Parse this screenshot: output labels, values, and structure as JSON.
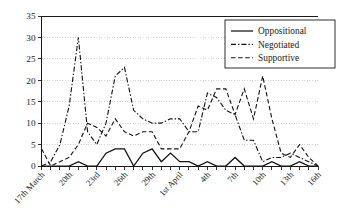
{
  "chart_data": {
    "type": "line",
    "title": "",
    "xlabel": "",
    "ylabel": "",
    "ylim": [
      0,
      35
    ],
    "yticks": [
      0,
      5,
      10,
      15,
      20,
      25,
      30,
      35
    ],
    "grid": true,
    "legend_position": "top-right",
    "x": [
      "17th March",
      "18th",
      "19th",
      "20th",
      "21st",
      "22nd",
      "23rd",
      "24th",
      "25th",
      "26th",
      "27th",
      "28th",
      "29th",
      "30th",
      "31st",
      "1st April",
      "2nd",
      "3rd",
      "4th",
      "5th",
      "6th",
      "7th",
      "8th",
      "9th",
      "10th",
      "11th",
      "12th",
      "13th",
      "14th",
      "15th",
      "16th"
    ],
    "xtick_labels": [
      "17th March",
      "20th",
      "23rd",
      "26th",
      "29th",
      "1st April",
      "4th",
      "7th",
      "10th",
      "13th",
      "16th"
    ],
    "xtick_indices": [
      0,
      3,
      6,
      9,
      12,
      15,
      18,
      21,
      24,
      27,
      30
    ],
    "series": [
      {
        "name": "Oppositional",
        "style": "solid",
        "values": [
          0,
          0,
          0,
          0,
          1,
          0,
          0,
          3,
          4,
          4,
          0,
          3,
          4,
          1,
          3,
          1,
          1,
          0,
          1,
          0,
          0,
          2,
          0,
          0,
          0,
          1,
          0,
          0,
          1,
          0,
          0
        ]
      },
      {
        "name": "Negotiated",
        "style": "dash-dot",
        "values": [
          0,
          1,
          5,
          14,
          30,
          8,
          5,
          10,
          21,
          23,
          13,
          11,
          10,
          10,
          11,
          11,
          8,
          8,
          17,
          16,
          13,
          12,
          6,
          6,
          1,
          2,
          2,
          3,
          2,
          1,
          0
        ]
      },
      {
        "name": "Supportive",
        "style": "dashed",
        "values": [
          4,
          0,
          1,
          2,
          5,
          10,
          9,
          7,
          11,
          8,
          7,
          8,
          8,
          4,
          4,
          4,
          8,
          14,
          13,
          18,
          18,
          12,
          18,
          11,
          21,
          11,
          3,
          2,
          5,
          2,
          0
        ]
      }
    ]
  },
  "legend": {
    "items": [
      {
        "label": "Oppositional",
        "style": "solid"
      },
      {
        "label": "Negotiated",
        "style": "dash-dot"
      },
      {
        "label": "Supportive",
        "style": "dashed"
      }
    ]
  }
}
